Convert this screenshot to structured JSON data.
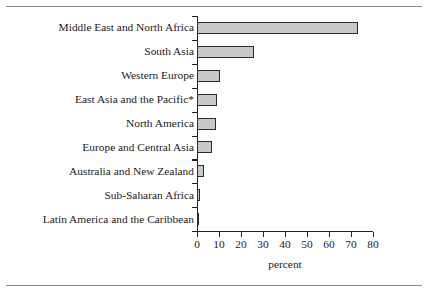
{
  "figure": {
    "background_color": "#ffffff",
    "rule_color": "#8a8a8a",
    "axis_color": "#222222",
    "bar_fill_color": "#c8c8c8",
    "bar_edge_color": "#2b2b2b"
  },
  "chart_data": {
    "type": "bar",
    "orientation": "horizontal",
    "title": "",
    "subtitle": "",
    "xlabel": "percent",
    "ylabel": "",
    "categories": [
      "Middle East and North Africa",
      "South Asia",
      "Western Europe",
      "East Asia and the Pacific*",
      "North America",
      "Europe and Central Asia",
      "Australia and New Zealand",
      "Sub-Saharan Africa",
      "Latin America and the Caribbean"
    ],
    "values": [
      73,
      26,
      10.5,
      9,
      8.5,
      7,
      3,
      1.5,
      1
    ],
    "xlim": [
      0,
      80
    ],
    "xticks": [
      0,
      10,
      20,
      30,
      40,
      50,
      60,
      70,
      80
    ],
    "xtick_labels": [
      "0",
      "10",
      "20",
      "30",
      "40",
      "50",
      "60",
      "70",
      "80"
    ],
    "grid": false,
    "legend": null,
    "annotations": [
      "*"
    ]
  }
}
